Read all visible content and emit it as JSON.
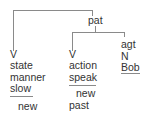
{
  "diagram": {
    "type": "dependency-tree",
    "root": {
      "label": "pat"
    },
    "nodes": [
      {
        "id": "left",
        "lines": [
          "V",
          "state",
          "manner",
          "slow",
          "new"
        ],
        "underlined": "slow"
      },
      {
        "id": "middle",
        "lines": [
          "V",
          "action",
          "speak",
          "new",
          "past"
        ],
        "underlined": "speak"
      },
      {
        "id": "right",
        "lines": [
          "agt",
          "N",
          "Bob"
        ],
        "underlined": "Bob"
      }
    ],
    "colors": {
      "line": "#8a8a8a",
      "text": "#333333"
    }
  }
}
